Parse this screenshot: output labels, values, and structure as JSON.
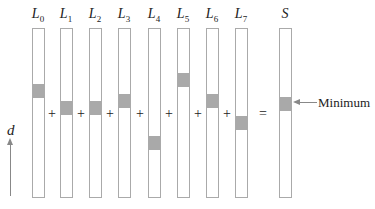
{
  "columns": [
    {
      "label": "L",
      "sub": "0",
      "x": 32,
      "band_top": 83
    },
    {
      "label": "L",
      "sub": "1",
      "x": 60,
      "band_top": 100
    },
    {
      "label": "L",
      "sub": "2",
      "x": 89,
      "band_top": 100
    },
    {
      "label": "L",
      "sub": "3",
      "x": 118,
      "band_top": 93
    },
    {
      "label": "L",
      "sub": "4",
      "x": 148,
      "band_top": 135
    },
    {
      "label": "L",
      "sub": "5",
      "x": 177,
      "band_top": 72
    },
    {
      "label": "L",
      "sub": "6",
      "x": 206,
      "band_top": 93
    },
    {
      "label": "L",
      "sub": "7",
      "x": 235,
      "band_top": 115
    },
    {
      "label": "S",
      "sub": "",
      "x": 279,
      "band_top": 96
    }
  ],
  "operators": [
    {
      "sym": "+",
      "x": 52,
      "y": 114
    },
    {
      "sym": "+",
      "x": 81,
      "y": 114
    },
    {
      "sym": "+",
      "x": 110,
      "y": 114
    },
    {
      "sym": "+",
      "x": 140,
      "y": 114
    },
    {
      "sym": "+",
      "x": 169,
      "y": 114
    },
    {
      "sym": "+",
      "x": 198,
      "y": 114
    },
    {
      "sym": "+",
      "x": 227,
      "y": 114
    },
    {
      "sym": "=",
      "x": 263,
      "y": 114
    }
  ],
  "axis": {
    "label": "d"
  },
  "annotation": {
    "label": "Minimum"
  }
}
